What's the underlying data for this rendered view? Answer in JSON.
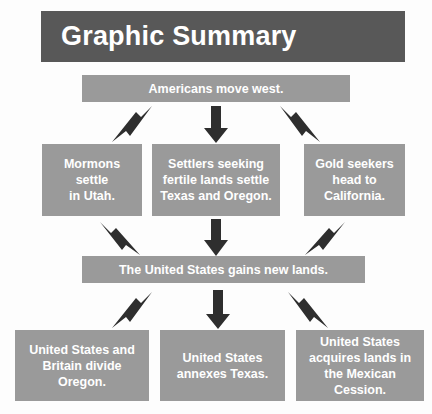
{
  "title": {
    "text": "Graphic Summary"
  },
  "colors": {
    "background": "#fdfdfd",
    "title_banner": "#585858",
    "box_fill": "#9a9a9a",
    "box_text": "#ffffff",
    "arrow": "#2e2e2e"
  },
  "flow": {
    "cause": {
      "label": "Americans move west."
    },
    "effects": [
      {
        "label": "Mormons settle in Utah.",
        "lines": [
          "Mormons",
          "settle",
          "in Utah."
        ]
      },
      {
        "label": "Settlers seeking fertile lands settle Texas and Oregon.",
        "lines": [
          "Settlers seeking",
          "fertile lands settle",
          "Texas and Oregon."
        ]
      },
      {
        "label": "Gold seekers head to California.",
        "lines": [
          "Gold seekers",
          "head to",
          "California."
        ]
      }
    ],
    "middle": {
      "label": "The United States gains new lands."
    },
    "outcomes": [
      {
        "label": "United States and Britain divide Oregon.",
        "lines": [
          "United States and",
          "Britain divide",
          "Oregon."
        ]
      },
      {
        "label": "United States annexes Texas.",
        "lines": [
          "United States",
          "annexes Texas."
        ]
      },
      {
        "label": "United States acquires lands in the Mexican Cession.",
        "lines": [
          "United States",
          "acquires lands in",
          "the Mexican",
          "Cession."
        ]
      }
    ]
  },
  "arrows": {
    "diverging_top": [
      "arrow-down-left-icon",
      "arrow-down-icon",
      "arrow-down-right-icon"
    ],
    "converging_middle": [
      "arrow-down-right-icon",
      "arrow-down-icon",
      "arrow-down-left-icon"
    ],
    "diverging_bottom": [
      "arrow-down-left-icon",
      "arrow-down-icon",
      "arrow-down-right-icon"
    ]
  }
}
